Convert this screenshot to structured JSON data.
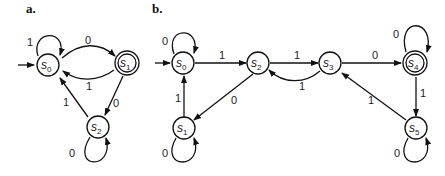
{
  "panels": {
    "a": {
      "label": "a.",
      "states": {
        "s0": {
          "name": "s",
          "index": "0",
          "accepting": false,
          "start": true
        },
        "s1": {
          "name": "s",
          "index": "1",
          "accepting": true
        },
        "s2": {
          "name": "s",
          "index": "2",
          "accepting": false
        }
      },
      "transitions": {
        "s0_s0": "1",
        "s0_s1": "0",
        "s1_s0": "1",
        "s1_s2": "0",
        "s2_s0": "1",
        "s2_s2": "0"
      }
    },
    "b": {
      "label": "b.",
      "states": {
        "s0": {
          "name": "s",
          "index": "0",
          "accepting": false,
          "start": true
        },
        "s1": {
          "name": "s",
          "index": "1",
          "accepting": false
        },
        "s2": {
          "name": "s",
          "index": "2",
          "accepting": false
        },
        "s3": {
          "name": "s",
          "index": "3",
          "accepting": false
        },
        "s4": {
          "name": "s",
          "index": "4",
          "accepting": true
        },
        "s5": {
          "name": "s",
          "index": "5",
          "accepting": false
        }
      },
      "transitions": {
        "s0_s0": "0",
        "s0_s2": "1",
        "s2_s1": "0",
        "s1_s0": "1",
        "s1_s1": "0",
        "s2_s3": "1",
        "s3_s2": "1",
        "s3_s4": "0",
        "s4_s4": "0",
        "s4_s5": "1",
        "s5_s3": "1",
        "s5_s5": "0"
      }
    }
  }
}
